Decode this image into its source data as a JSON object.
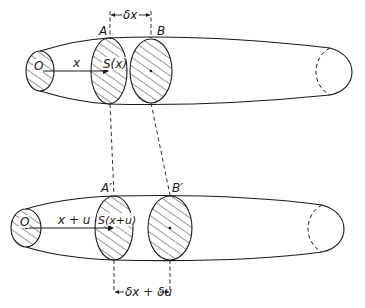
{
  "figure": {
    "top": {
      "origin_label": "O",
      "distance_label": "x",
      "section_A_label": "A",
      "section_B_label": "B",
      "area_label": "S(x)",
      "spacing_label": "δx"
    },
    "bottom": {
      "origin_label": "O",
      "distance_label": "x + u",
      "section_A_label": "A′",
      "section_B_label": "B′",
      "area_label": "S(x+u)",
      "spacing_label": "δx + δu"
    },
    "colors": {
      "stroke": "#1a1a1a",
      "background": "#ffffff"
    }
  }
}
